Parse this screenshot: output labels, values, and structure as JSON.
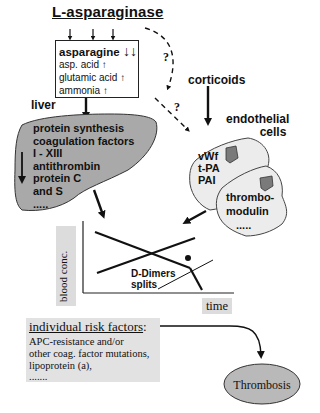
{
  "title": "L-asparaginase",
  "amino_box": {
    "main": "asparagine",
    "main_arrow": "↓↓",
    "items": [
      {
        "label": "asp. acid",
        "arrow": "↑"
      },
      {
        "label": "glutamic acid",
        "arrow": "↑"
      },
      {
        "label": "ammonia",
        "arrow": "↑"
      }
    ]
  },
  "question_marks": [
    "?",
    "?"
  ],
  "corticoids": "corticoids",
  "liver": {
    "label": "liver",
    "lines": [
      "protein synthesis",
      "coagulation factors",
      "I - XIII",
      "antithrombin",
      "protein C",
      "and S",
      "....."
    ],
    "arrow": "↓"
  },
  "endothelial": {
    "label_1": "endothelial",
    "label_2": "cells",
    "cell1_lines": [
      "vWf",
      "t-PA",
      "PAI"
    ],
    "cell2_lines": [
      "thrombo-",
      "modulin",
      "....."
    ]
  },
  "chart": {
    "ylabel": "blood conc.",
    "xlabel": "time",
    "annotation_1": "D-Dimers",
    "annotation_2": "splits"
  },
  "risk_factors": {
    "title": "individual risk factors",
    "title_suffix": ":",
    "lines": [
      "APC-resistance and/or",
      "other coag. factor  mutations,",
      "lipoprotein (a),",
      "......."
    ]
  },
  "outcome": "Thrombosis",
  "colors": {
    "liver_fill": "#a9a9a9",
    "cell_fill": "#ececec",
    "nucleus_fill": "#7a7a7a",
    "risk_box_fill": "#e2e2e2",
    "thrombosis_fill": "#b9b9b9"
  }
}
